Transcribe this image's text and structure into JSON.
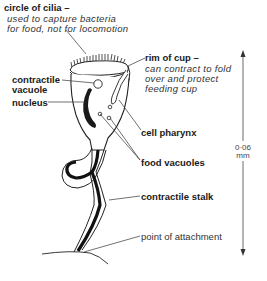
{
  "diagram": {
    "labels": {
      "cilia": {
        "title": "circle of cilia –",
        "desc_line1": "used to capture bacteria",
        "desc_line2": "for food, not for locomotion"
      },
      "rim": {
        "title": "rim of cup –",
        "desc_line1": "can contract to fold",
        "desc_line2": "over and protect",
        "desc_line3": "feeding cup"
      },
      "contractile_vacuole": {
        "line1": "contractile",
        "line2": "vacuole"
      },
      "nucleus": "nucleus",
      "cell_pharynx": "cell pharynx",
      "food_vacuoles": "food vacuoles",
      "contractile_stalk": "contractile stalk",
      "point_of_attachment": "point of attachment"
    },
    "scale_bar": {
      "value": "0·06",
      "unit": "mm"
    },
    "colors": {
      "ink": "#1a1a1a",
      "background": "#ffffff"
    }
  }
}
